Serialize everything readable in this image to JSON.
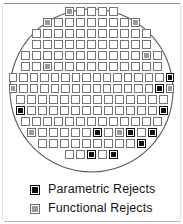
{
  "figure": {
    "title": "",
    "wafer": {
      "shape": "circle",
      "outline_color": "#5a5a5a"
    }
  },
  "legend": {
    "items": [
      {
        "key": "param",
        "label": "Parametric Rejects",
        "color": "#111111",
        "swatch_icon": "filled-square-icon"
      },
      {
        "key": "func",
        "label": "Functional Rejects",
        "color": "#9a9a9a",
        "swatch_icon": "gray-square-icon"
      }
    ]
  },
  "chart_data": {
    "type": "heatmap",
    "xlabel": "",
    "ylabel": "",
    "legend_position": "bottom-left",
    "categories": [
      "pass",
      "param",
      "func"
    ],
    "category_labels": {
      "pass": "Passing Die",
      "param": "Parametric Rejects",
      "func": "Functional Rejects"
    },
    "counts": {
      "pass": 137,
      "param": 14,
      "func": 9,
      "total": 160
    },
    "rows": [
      {
        "row": 1,
        "cells": [
          "func",
          "pass",
          "pass",
          "pass",
          "pass"
        ]
      },
      {
        "row": 2,
        "cells": [
          "func",
          "pass",
          "pass",
          "pass",
          "pass",
          "pass",
          "pass",
          "pass",
          "func"
        ]
      },
      {
        "row": 3,
        "cells": [
          "pass",
          "pass",
          "pass",
          "pass",
          "pass",
          "pass",
          "pass",
          "pass",
          "pass",
          "pass",
          "pass"
        ]
      },
      {
        "row": 4,
        "cells": [
          "pass",
          "pass",
          "pass",
          "pass",
          "pass",
          "pass",
          "pass",
          "pass",
          "pass",
          "pass",
          "pass"
        ]
      },
      {
        "row": 5,
        "cells": [
          "pass",
          "pass",
          "pass",
          "pass",
          "pass",
          "pass",
          "pass",
          "pass",
          "pass",
          "pass",
          "pass",
          "func",
          "pass"
        ]
      },
      {
        "row": 6,
        "cells": [
          "pass",
          "pass",
          "func",
          "pass",
          "pass",
          "pass",
          "pass",
          "pass",
          "pass",
          "pass",
          "pass",
          "pass",
          "pass"
        ]
      },
      {
        "row": 7,
        "cells": [
          "pass",
          "pass",
          "pass",
          "pass",
          "pass",
          "pass",
          "pass",
          "pass",
          "pass",
          "pass",
          "pass",
          "pass",
          "pass",
          "pass",
          "pass",
          "param"
        ]
      },
      {
        "row": 8,
        "cells": [
          "func",
          "pass",
          "pass",
          "pass",
          "pass",
          "pass",
          "pass",
          "pass",
          "pass",
          "pass",
          "pass",
          "pass",
          "pass",
          "pass",
          "param",
          "func"
        ]
      },
      {
        "row": 9,
        "cells": [
          "pass",
          "pass",
          "pass",
          "pass",
          "pass",
          "pass",
          "pass",
          "pass",
          "pass",
          "pass",
          "pass",
          "pass",
          "pass",
          "pass"
        ]
      },
      {
        "row": 10,
        "cells": [
          "param",
          "pass",
          "pass",
          "pass",
          "pass",
          "pass",
          "pass",
          "pass",
          "pass",
          "pass",
          "pass",
          "pass",
          "pass",
          "param"
        ]
      },
      {
        "row": 11,
        "cells": [
          "pass",
          "pass",
          "pass",
          "pass",
          "pass",
          "pass",
          "pass",
          "pass",
          "pass",
          "pass",
          "pass",
          "pass",
          "pass"
        ]
      },
      {
        "row": 12,
        "cells": [
          "func",
          "pass",
          "pass",
          "pass",
          "pass",
          "pass",
          "param",
          "pass",
          "func",
          "param",
          "pass",
          "param"
        ]
      },
      {
        "row": 13,
        "cells": [
          "pass",
          "pass",
          "pass",
          "pass",
          "pass",
          "pass",
          "pass",
          "pass",
          "pass",
          "param"
        ]
      },
      {
        "row": 14,
        "cells": [
          "pass",
          "pass",
          "param",
          "pass",
          "param"
        ]
      }
    ]
  }
}
